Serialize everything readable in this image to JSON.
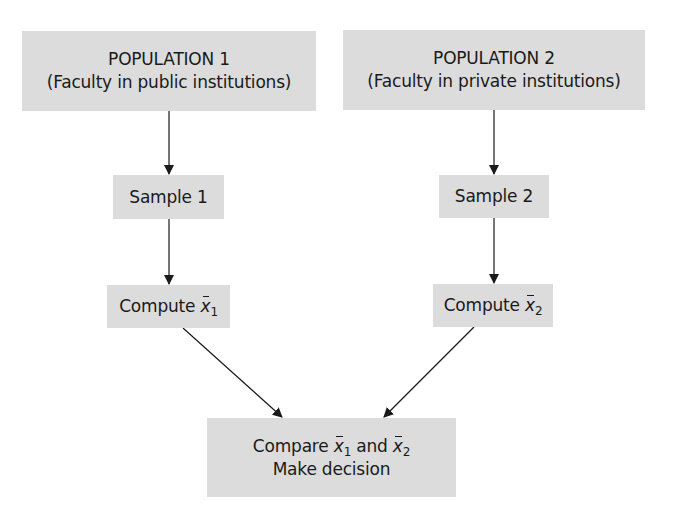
{
  "diagram": {
    "population1": {
      "title": "POPULATION 1",
      "subtitle": "(Faculty in public institutions)"
    },
    "population2": {
      "title": "POPULATION 2",
      "subtitle": "(Faculty in private institutions)"
    },
    "sample1": {
      "label": "Sample 1"
    },
    "sample2": {
      "label": "Sample 2"
    },
    "compute1": {
      "prefix": "Compute ",
      "var": "x",
      "sub": "1"
    },
    "compute2": {
      "prefix": "Compute ",
      "var": "x",
      "sub": "2"
    },
    "compare": {
      "prefix": "Compare ",
      "var1": "x",
      "sub1": "1",
      "middle": " and ",
      "var2": "x",
      "sub2": "2",
      "line2": "Make decision"
    },
    "colors": {
      "box_fill": "#dcdcdc",
      "arrow": "#1a1a1a",
      "background": "#ffffff"
    }
  }
}
